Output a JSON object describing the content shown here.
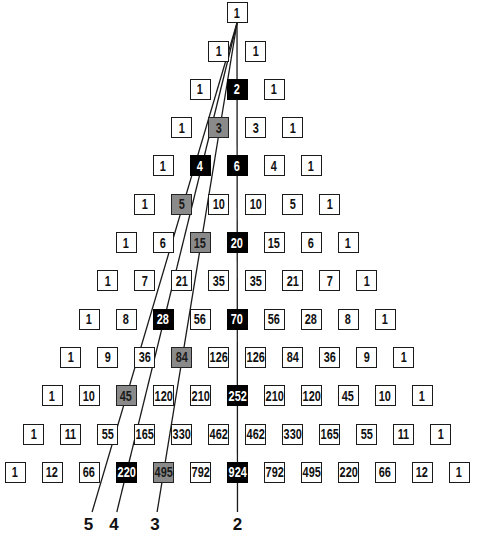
{
  "rows": [
    [
      1
    ],
    [
      1,
      1
    ],
    [
      1,
      2,
      1
    ],
    [
      1,
      3,
      3,
      1
    ],
    [
      1,
      4,
      6,
      4,
      1
    ],
    [
      1,
      5,
      10,
      10,
      5,
      1
    ],
    [
      1,
      6,
      15,
      20,
      15,
      6,
      1
    ],
    [
      1,
      7,
      21,
      35,
      35,
      21,
      7,
      1
    ],
    [
      1,
      8,
      28,
      56,
      70,
      56,
      28,
      8,
      1
    ],
    [
      1,
      9,
      36,
      84,
      126,
      126,
      84,
      36,
      9,
      1
    ],
    [
      1,
      10,
      45,
      120,
      210,
      252,
      210,
      120,
      45,
      10,
      1
    ],
    [
      1,
      11,
      55,
      165,
      330,
      462,
      462,
      330,
      165,
      55,
      11,
      1
    ],
    [
      1,
      12,
      66,
      220,
      495,
      792,
      924,
      792,
      495,
      220,
      66,
      12,
      1
    ]
  ],
  "colors": {
    "black": "#000000",
    "gray": "#8a8a8a",
    "plain": "#ffffff"
  },
  "diagonals": [
    {
      "label": "2",
      "style": "black",
      "cells": [
        [
          2,
          1
        ],
        [
          4,
          2
        ],
        [
          6,
          3
        ],
        [
          8,
          4
        ],
        [
          10,
          5
        ],
        [
          12,
          6
        ]
      ]
    },
    {
      "label": "3",
      "style": "gray",
      "cells": [
        [
          3,
          1
        ],
        [
          6,
          2
        ],
        [
          9,
          3
        ],
        [
          12,
          4
        ]
      ]
    },
    {
      "label": "4",
      "style": "black",
      "cells": [
        [
          4,
          1
        ],
        [
          8,
          2
        ],
        [
          12,
          3
        ]
      ]
    },
    {
      "label": "5",
      "style": "gray",
      "cells": [
        [
          5,
          1
        ],
        [
          10,
          2
        ]
      ]
    }
  ]
}
